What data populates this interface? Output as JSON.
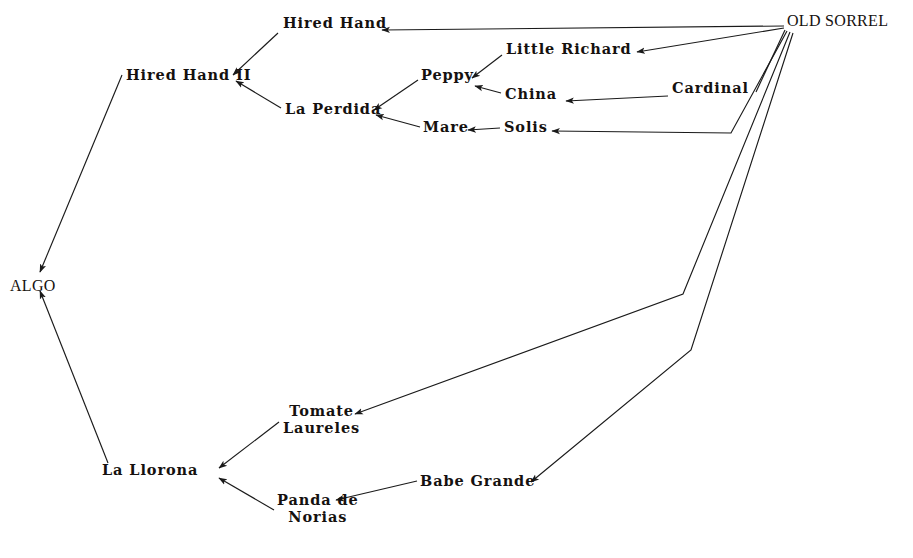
{
  "diagram": {
    "type": "pedigree-tree",
    "background_color": "#ffffff",
    "line_color": "#1a1a1a",
    "text_color": "#15110f",
    "width": 913,
    "height": 558
  },
  "nodes": [
    {
      "id": "old_sorrel",
      "label": "OLD SORREL",
      "style": "roman",
      "x": 787,
      "y": 12,
      "align": "left"
    },
    {
      "id": "hired_hand",
      "label": "Hired Hand",
      "style": "mono",
      "x": 283,
      "y": 15,
      "align": "left"
    },
    {
      "id": "little_richard",
      "label": "Little Richard",
      "style": "mono",
      "x": 506,
      "y": 41,
      "align": "left"
    },
    {
      "id": "hired_hand_ii",
      "label": "Hired Hand II",
      "style": "mono",
      "x": 126,
      "y": 67,
      "align": "left"
    },
    {
      "id": "peppy",
      "label": "Peppy",
      "style": "mono",
      "x": 421,
      "y": 67,
      "align": "left"
    },
    {
      "id": "china",
      "label": "China",
      "style": "mono",
      "x": 505,
      "y": 86,
      "align": "left"
    },
    {
      "id": "cardinal",
      "label": "Cardinal",
      "style": "mono",
      "x": 672,
      "y": 80,
      "align": "left"
    },
    {
      "id": "la_perdida",
      "label": "La Perdida",
      "style": "mono",
      "x": 285,
      "y": 101,
      "align": "left"
    },
    {
      "id": "mare",
      "label": "Mare",
      "style": "mono",
      "x": 423,
      "y": 119,
      "align": "left"
    },
    {
      "id": "solis",
      "label": "Solis",
      "style": "mono",
      "x": 504,
      "y": 119,
      "align": "left"
    },
    {
      "id": "algo",
      "label": "ALGO",
      "style": "roman",
      "x": 10,
      "y": 277,
      "align": "left"
    },
    {
      "id": "tomate",
      "label": "Tomate\nLaureles",
      "style": "mono",
      "x": 283,
      "y": 403,
      "align": "center"
    },
    {
      "id": "la_llorona",
      "label": "La Llorona",
      "style": "mono",
      "x": 102,
      "y": 462,
      "align": "left"
    },
    {
      "id": "babe_grande",
      "label": "Babe Grande",
      "style": "mono",
      "x": 420,
      "y": 473,
      "align": "left"
    },
    {
      "id": "panda",
      "label": "Panda de\nNorias",
      "style": "mono",
      "x": 277,
      "y": 492,
      "align": "center"
    }
  ],
  "edges": [
    {
      "id": "e-os-hired-hand",
      "from": "old_sorrel",
      "to": "hired_hand",
      "arrow": true,
      "points": "784,26 382,30"
    },
    {
      "id": "e-os-little-richard",
      "from": "old_sorrel",
      "to": "little_richard",
      "arrow": true,
      "points": "784,28 637,52"
    },
    {
      "id": "e-os-cardinal",
      "from": "old_sorrel",
      "to": "cardinal",
      "arrow": false,
      "points": "785,30 756,92"
    },
    {
      "id": "e-os-solis",
      "from": "old_sorrel",
      "to": "solis",
      "arrow": true,
      "points": "787,31 731,133 552,131"
    },
    {
      "id": "e-os-tomate",
      "from": "old_sorrel",
      "to": "tomate",
      "arrow": true,
      "points": "790,32 683,294 355,414"
    },
    {
      "id": "e-os-babe-grande",
      "from": "old_sorrel",
      "to": "babe_grande",
      "arrow": true,
      "points": "793,33 691,350 531,482"
    },
    {
      "id": "e-hh-hhii",
      "from": "hired_hand",
      "to": "hired_hand_ii",
      "arrow": true,
      "points": "278,33 233,75"
    },
    {
      "id": "e-lr-peppy",
      "from": "little_richard",
      "to": "peppy",
      "arrow": true,
      "points": "502,55 472,78"
    },
    {
      "id": "e-china-peppy",
      "from": "china",
      "to": "peppy",
      "arrow": true,
      "points": "501,93 475,86"
    },
    {
      "id": "e-cardinal-china",
      "from": "cardinal",
      "to": "china",
      "arrow": true,
      "points": "668,96 566,101"
    },
    {
      "id": "e-peppy-laperdida",
      "from": "peppy",
      "to": "la_perdida",
      "arrow": true,
      "points": "418,80 374,110"
    },
    {
      "id": "e-mare-laperdida",
      "from": "mare",
      "to": "la_perdida",
      "arrow": true,
      "points": "420,127 376,115"
    },
    {
      "id": "e-solis-mare",
      "from": "solis",
      "to": "mare",
      "arrow": true,
      "points": "500,128 468,130"
    },
    {
      "id": "e-laperdida-hhii",
      "from": "la_perdida",
      "to": "hired_hand_ii",
      "arrow": true,
      "points": "281,108 236,81"
    },
    {
      "id": "e-hhii-algo",
      "from": "hired_hand_ii",
      "to": "algo",
      "arrow": true,
      "points": "122,75 40,272"
    },
    {
      "id": "e-tomate-llorona",
      "from": "tomate",
      "to": "la_llorona",
      "arrow": true,
      "points": "279,422 219,468"
    },
    {
      "id": "e-panda-llorona",
      "from": "panda",
      "to": "la_llorona",
      "arrow": true,
      "points": "274,510 219,478"
    },
    {
      "id": "e-babe-panda",
      "from": "babe_grande",
      "to": "panda",
      "arrow": true,
      "points": "417,481 336,500"
    },
    {
      "id": "e-llorona-algo",
      "from": "la_llorona",
      "to": "algo",
      "arrow": true,
      "points": "108,463 40,291"
    }
  ]
}
